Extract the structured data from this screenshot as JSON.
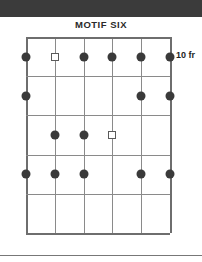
{
  "banner": {
    "color": "#3b3b3b"
  },
  "title": "MOTIF SIX",
  "fret_label": "10 fr",
  "colors": {
    "dot": "#3a3a3a",
    "square_border": "#5a5a5a",
    "grid_line": "#8a8a8a",
    "grid_edge": "#6e6e6e",
    "banner": "#3b3b3b",
    "rule": "#777777"
  },
  "fretboard": {
    "string_count": 6,
    "fret_count": 5,
    "strings": [
      {
        "index": 1,
        "x": 0
      },
      {
        "index": 2,
        "x": 28.8
      },
      {
        "index": 3,
        "x": 57.6
      },
      {
        "index": 4,
        "x": 86.4
      },
      {
        "index": 5,
        "x": 115.2
      },
      {
        "index": 6,
        "x": 144
      }
    ],
    "frets": [
      {
        "index": 1,
        "y": 0
      },
      {
        "index": 2,
        "y": 39.2
      },
      {
        "index": 3,
        "y": 78.4
      },
      {
        "index": 4,
        "y": 117.6
      },
      {
        "index": 5,
        "y": 156.8
      },
      {
        "index": 6,
        "y": 196
      }
    ],
    "rows": [
      {
        "row": 1,
        "center_y": 19.6,
        "markers": [
          "dot",
          "square",
          "dot",
          "dot",
          "dot",
          "dot"
        ]
      },
      {
        "row": 2,
        "center_y": 58.8,
        "markers": [
          "dot",
          "none",
          "none",
          "none",
          "dot",
          "dot"
        ]
      },
      {
        "row": 3,
        "center_y": 98,
        "markers": [
          "none",
          "dot",
          "dot",
          "square",
          "none",
          "none"
        ]
      },
      {
        "row": 4,
        "center_y": 137.2,
        "markers": [
          "dot",
          "dot",
          "dot",
          "none",
          "dot",
          "dot"
        ]
      },
      {
        "row": 5,
        "center_y": 176.4,
        "markers": [
          "none",
          "none",
          "none",
          "none",
          "none",
          "none"
        ]
      }
    ]
  }
}
